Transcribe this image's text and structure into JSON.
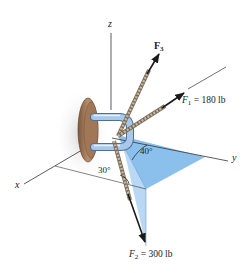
{
  "diagram": {
    "axes": {
      "x": "x",
      "y": "y",
      "z": "z"
    },
    "forces": {
      "F1": {
        "name": "F",
        "sub": "1",
        "value_text": " = 180 lb",
        "magnitude": 180,
        "unit": "lb"
      },
      "F2": {
        "name": "F",
        "sub": "2",
        "value_text": " = 300 lb",
        "magnitude": 300,
        "unit": "lb"
      },
      "F3": {
        "name": "F",
        "sub": "3"
      }
    },
    "angles": {
      "a30": "30°",
      "a40": "40°"
    },
    "colors": {
      "plane_light": "#b8d8f4",
      "plane_mid": "#8cc0ec",
      "plane_dark": "#6aa8e0",
      "plate": "#a07858",
      "pipe": "#a9c7e8",
      "rope": "#b8a892",
      "arrow": "#1a1a1a"
    }
  }
}
